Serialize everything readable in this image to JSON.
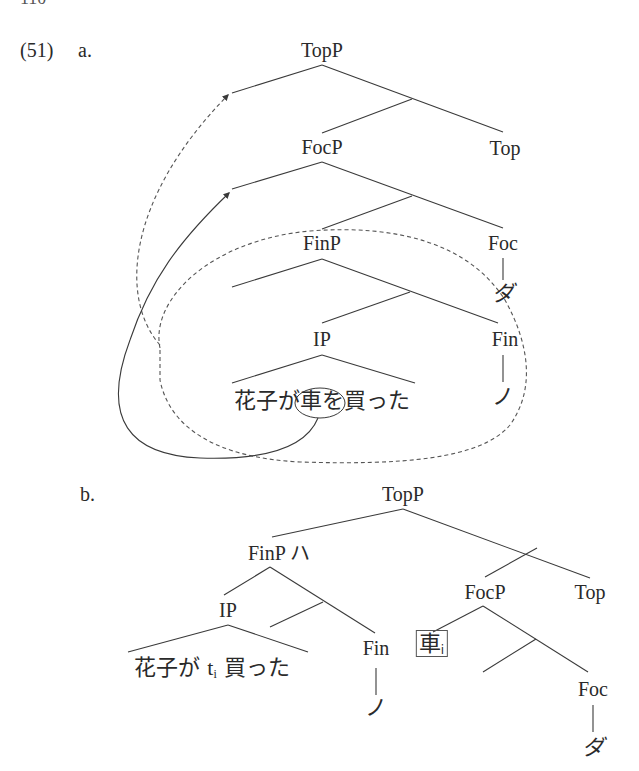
{
  "page": {
    "page_number": "110"
  },
  "example": {
    "number": "(51)",
    "a": {
      "label": "a.",
      "nodes": {
        "topp": "TopP",
        "top": "Top",
        "focp": "FocP",
        "foc": "Foc",
        "foc_head": "ダ",
        "finp": "FinP",
        "fin": "Fin",
        "fin_head": "ノ",
        "ip": "IP"
      },
      "sentence": {
        "pre": "花子が",
        "circled": "車を",
        "post": "買った"
      },
      "annotations": {
        "solid_arrow": "movement of 車 to Spec-FocP",
        "dashed_arrow": "movement of FinP to Spec-TopP",
        "dashed_enclosure": "FinP constituent"
      }
    },
    "b": {
      "label": "b.",
      "nodes": {
        "topp": "TopP",
        "finp_ha": "FinP ハ",
        "ip": "IP",
        "fin": "Fin",
        "fin_head": "ノ",
        "focp": "FocP",
        "top": "Top",
        "foc": "Foc",
        "foc_head": "ダ"
      },
      "sentence": {
        "pre": "花子が ",
        "trace": "t",
        "trace_index": "i",
        "post": " 買った"
      },
      "boxed_item": {
        "text": "車",
        "index": "i"
      }
    }
  }
}
